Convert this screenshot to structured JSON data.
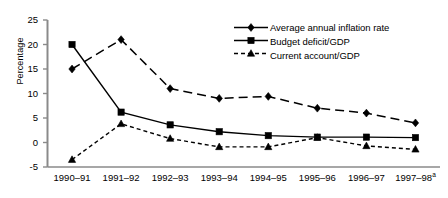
{
  "chart_data": {
    "type": "line",
    "title": "",
    "xlabel": "",
    "ylabel": "Percentage",
    "ylim": [
      -5,
      25
    ],
    "ytick_values": [
      25,
      20,
      15,
      10,
      5,
      0,
      -5
    ],
    "ytick_labels": [
      "25",
      "20",
      "15",
      "10",
      "5",
      "0",
      "-5"
    ],
    "grid": false,
    "legend_position": "top-right",
    "categories": [
      "1990–91",
      "1991–92",
      "1992–93",
      "1993–94",
      "1994–95",
      "1995–96",
      "1996–97",
      "1997–98"
    ],
    "category_footnotes": [
      "",
      "",
      "",
      "",
      "",
      "",
      "",
      "a"
    ],
    "series": [
      {
        "name": "Average annual inflation rate",
        "marker": "diamond",
        "linestyle": "dashed-long",
        "values": [
          15.0,
          21.0,
          11.0,
          9.0,
          9.4,
          7.0,
          6.0,
          4.0
        ]
      },
      {
        "name": "Budget deficit/GDP",
        "marker": "square",
        "linestyle": "solid",
        "values": [
          20.0,
          6.2,
          3.6,
          2.2,
          1.4,
          1.1,
          1.1,
          1.0
        ]
      },
      {
        "name": "Current account/GDP",
        "marker": "triangle",
        "linestyle": "dashed-short",
        "values": [
          -3.5,
          3.8,
          0.8,
          -0.9,
          -0.9,
          1.0,
          -0.7,
          -1.4
        ]
      }
    ]
  },
  "legend": {
    "items": [
      {
        "label": "Average annual inflation rate",
        "marker": "diamond",
        "linestyle": "solid"
      },
      {
        "label": "Budget deficit/GDP",
        "marker": "square",
        "linestyle": "solid"
      },
      {
        "label": "Current account/GDP",
        "marker": "triangle",
        "linestyle": "dashed"
      }
    ]
  },
  "colors": {
    "line": "#000000",
    "marker": "#000000",
    "axis": "#808080",
    "background": "#ffffff"
  }
}
